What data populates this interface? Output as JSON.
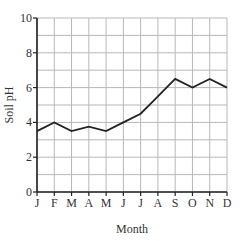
{
  "chart_data": {
    "type": "line",
    "title": "",
    "xlabel": "Month",
    "ylabel": "Soil pH",
    "categories": [
      "J",
      "F",
      "M",
      "A",
      "M",
      "J",
      "J",
      "A",
      "S",
      "O",
      "N",
      "D"
    ],
    "series": [
      {
        "name": "Soil pH",
        "values": [
          3.5,
          4.0,
          3.5,
          3.75,
          3.5,
          4.0,
          4.5,
          5.5,
          6.5,
          6.0,
          6.5,
          6.0
        ]
      }
    ],
    "ylim": [
      0,
      10
    ],
    "yticks": [
      0,
      2,
      4,
      6,
      8,
      10
    ],
    "grid": true,
    "grid_y_step": 1,
    "legend": "none"
  },
  "colors": {
    "line": "#222222",
    "grid": "#b8b8b8",
    "axis": "#222222"
  }
}
